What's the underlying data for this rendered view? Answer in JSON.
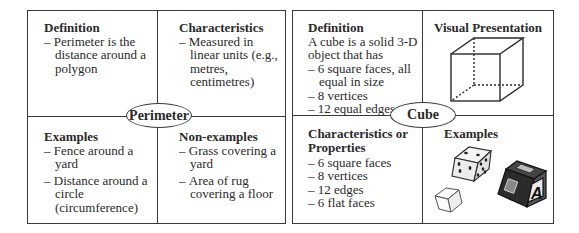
{
  "left_model": {
    "center_label": "Perimeter",
    "definition": {
      "heading": "Definition",
      "items": [
        "Perimeter is the distance around a polygon"
      ]
    },
    "characteristics": {
      "heading": "Characteristics",
      "items": [
        "Measured in linear units (e.g., metres, centimetres)"
      ]
    },
    "examples": {
      "heading": "Examples",
      "items": [
        "Fence around a yard",
        "Distance around a circle (circumference)"
      ]
    },
    "non_examples": {
      "heading": "Non-examples",
      "items": [
        "Grass covering a yard",
        "Area of rug covering a floor"
      ]
    }
  },
  "right_model": {
    "center_label": "Cube",
    "definition": {
      "heading": "Definition",
      "intro": "A cube is a solid 3-D object that has",
      "items": [
        "6 square faces, all equal in size",
        "8 vertices",
        "12 equal edges"
      ]
    },
    "visual": {
      "heading": "Visual Presentation",
      "icon": "wireframe-cube-icon"
    },
    "characteristics": {
      "heading": "Characteristics or Properties",
      "items": [
        "6 square faces",
        "8 vertices",
        "12 edges",
        "6 flat faces"
      ]
    },
    "examples": {
      "heading": "Examples",
      "images": [
        "dice-icon",
        "small-cube-icon",
        "letter-block-icon"
      ],
      "block_letter": "A"
    }
  }
}
